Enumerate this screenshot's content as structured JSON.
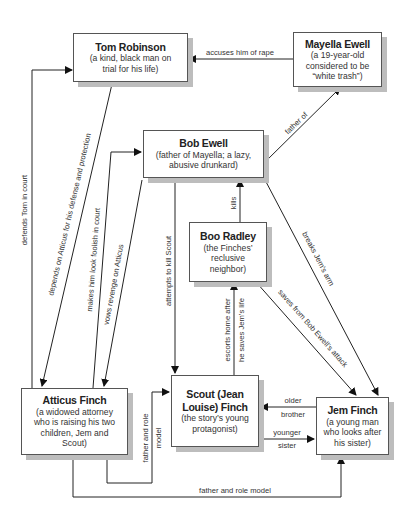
{
  "diagram": {
    "type": "character-relationship-map",
    "nodes": [
      {
        "id": "tom",
        "name": "Tom Robinson",
        "desc": "(a kind, black man on trial for his life)"
      },
      {
        "id": "mayella",
        "name": "Mayella Ewell",
        "desc": "(a 19-year-old considered to be “white trash”)"
      },
      {
        "id": "bob",
        "name": "Bob Ewell",
        "desc": "(father of Mayella; a lazy, abusive drunkard)"
      },
      {
        "id": "boo",
        "name": "Boo Radley",
        "desc": "(the Finches’ reclusive neighbor)"
      },
      {
        "id": "atticus",
        "name": "Atticus Finch",
        "desc": "(a widowed attorney who is raising his two children, Jem and Scout)"
      },
      {
        "id": "scout",
        "name": "Scout (Jean Louise) Finch",
        "desc": "(the story’s young protagonist)"
      },
      {
        "id": "jem",
        "name": "Jem Finch",
        "desc": "(a young man who looks after his sister)"
      }
    ],
    "edges": [
      {
        "from": "mayella",
        "to": "tom",
        "label": "accuses him of rape"
      },
      {
        "from": "atticus",
        "to": "tom",
        "label": "defends Tom in court"
      },
      {
        "from": "tom",
        "to": "atticus",
        "label": "depends on Atticus for his defense and protection"
      },
      {
        "from": "atticus",
        "to": "bob",
        "label": "makes him look foolish in court"
      },
      {
        "from": "bob",
        "to": "atticus",
        "label": "vows revenge on Atticus"
      },
      {
        "from": "bob",
        "to": "mayella",
        "label": "father of"
      },
      {
        "from": "bob",
        "to": "scout",
        "label": "attempts to kill Scout"
      },
      {
        "from": "boo",
        "to": "bob",
        "label": "kills"
      },
      {
        "from": "bob",
        "to": "jem",
        "label": "breaks Jem’s arm"
      },
      {
        "from": "boo",
        "to": "jem",
        "label": "saves from Bob Ewell’s attack"
      },
      {
        "from": "scout",
        "to": "boo",
        "label": "escorts home after he saves Jem’s life"
      },
      {
        "from": "atticus",
        "to": "scout",
        "label": "father and role model"
      },
      {
        "from": "jem",
        "to": "scout",
        "label": "older brother"
      },
      {
        "from": "scout",
        "to": "jem",
        "label": "younger sister"
      },
      {
        "from": "atticus",
        "to": "jem",
        "label": "father and role model"
      }
    ]
  },
  "labels": {
    "accuses": "accuses him of rape",
    "defends": "defends Tom in court",
    "depends": "depends on Atticus for his defense and protection",
    "foolish": "makes him look foolish in court",
    "revenge": "vows revenge on Atticus",
    "father_of": "father of",
    "attempts": "attempts to kill Scout",
    "kills": "kills",
    "breaks": "breaks Jem’s arm",
    "saves": "saves from Bob Ewell’s attack",
    "escorts_1": "escorts home after",
    "escorts_2": "he saves Jem’s life",
    "role_scout_1": "father and role",
    "role_scout_2": "model",
    "older_1": "older",
    "older_2": "brother",
    "younger_1": "younger",
    "younger_2": "sister",
    "role_jem": "father and role model"
  },
  "nodes": {
    "tom": {
      "name": "Tom Robinson",
      "desc": "(a kind, black man on trial for his life)"
    },
    "mayella": {
      "name": "Mayella Ewell",
      "desc": "(a 19-year-old considered to be “white trash”)"
    },
    "bob": {
      "name": "Bob Ewell",
      "desc": "(father of Mayella; a lazy, abusive drunkard)"
    },
    "boo": {
      "name": "Boo Radley",
      "desc": "(the Finches’ reclusive neighbor)"
    },
    "atticus": {
      "name": "Atticus Finch",
      "desc": "(a widowed attorney who is raising his two children, Jem and Scout)"
    },
    "scout": {
      "name": "Scout (Jean Louise) Finch",
      "desc": "(the story’s young protagonist)"
    },
    "jem": {
      "name": "Jem Finch",
      "desc": "(a young man who looks after his sister)"
    }
  },
  "colors": {
    "line": "#222222",
    "border": "#555555",
    "shadow": "#bdbdbd"
  }
}
